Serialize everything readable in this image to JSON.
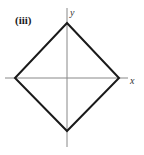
{
  "figure": {
    "panel_label": "(iii)",
    "x_axis_label": "x",
    "y_axis_label": "y",
    "shape": "diamond",
    "colors": {
      "background": "#ffffff",
      "axis": "#888888",
      "shape": "#1a1a1a",
      "text": "#1a1a1a"
    },
    "geometry": {
      "origin": [
        67,
        78
      ],
      "x_axis": {
        "from": [
          5,
          78
        ],
        "to": [
          128,
          78
        ]
      },
      "y_axis": {
        "from": [
          67,
          8
        ],
        "to": [
          67,
          147
        ]
      },
      "vertices": [
        {
          "name": "top",
          "point": [
            67,
            23
          ]
        },
        {
          "name": "right",
          "point": [
            119,
            78
          ]
        },
        {
          "name": "bottom",
          "point": [
            67,
            131
          ]
        },
        {
          "name": "left",
          "point": [
            15,
            78
          ]
        }
      ]
    }
  }
}
